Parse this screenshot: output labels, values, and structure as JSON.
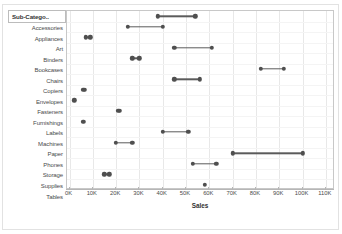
{
  "header": {
    "label": "Sub-Catego.."
  },
  "axis": {
    "x_title": "Sales",
    "x_ticks": [
      "0K",
      "10K",
      "20K",
      "30K",
      "40K",
      "50K",
      "60K",
      "70K",
      "80K",
      "90K",
      "100K",
      "110K"
    ]
  },
  "chart_data": {
    "type": "bar",
    "subtype": "dumbbell-range",
    "title": "",
    "xlabel": "Sales",
    "ylabel": "Sub-Catego..",
    "xlim": [
      0,
      115000
    ],
    "grid": true,
    "legend": "none",
    "categories": [
      "Accessories",
      "Appliances",
      "Art",
      "Binders",
      "Bookcases",
      "Chairs",
      "Copiers",
      "Envelopes",
      "Fasteners",
      "Furnishings",
      "Labels",
      "Machines",
      "Paper",
      "Phones",
      "Storage",
      "Supplies",
      "Tables"
    ],
    "series": [
      {
        "name": "Sales min",
        "values": [
          38000,
          25000,
          7000,
          45000,
          27000,
          82000,
          45000,
          6000,
          2000,
          21000,
          6000,
          40000,
          20000,
          70000,
          53000,
          15000,
          58000
        ]
      },
      {
        "name": "Sales max",
        "values": [
          54000,
          40000,
          9000,
          61000,
          30000,
          92000,
          56000,
          6500,
          2200,
          21500,
          6200,
          51000,
          27000,
          100000,
          63000,
          17000,
          58000
        ]
      }
    ],
    "marks": [
      {
        "category": "Accessories",
        "low": 38000,
        "high": 54000
      },
      {
        "category": "Appliances",
        "low": 25000,
        "high": 40000
      },
      {
        "category": "Art",
        "low": 7000,
        "high": 9000
      },
      {
        "category": "Binders",
        "low": 45000,
        "high": 61000
      },
      {
        "category": "Bookcases",
        "low": 27000,
        "high": 30000
      },
      {
        "category": "Chairs",
        "low": 82000,
        "high": 92000
      },
      {
        "category": "Copiers",
        "low": 45000,
        "high": 56000
      },
      {
        "category": "Envelopes",
        "low": 6000,
        "high": 6500
      },
      {
        "category": "Fasteners",
        "low": 2000,
        "high": 2200
      },
      {
        "category": "Furnishings",
        "low": 21000,
        "high": 21500
      },
      {
        "category": "Labels",
        "low": 6000,
        "high": 6200
      },
      {
        "category": "Machines",
        "low": 40000,
        "high": 51000
      },
      {
        "category": "Paper",
        "low": 20000,
        "high": 27000
      },
      {
        "category": "Phones",
        "low": 70000,
        "high": 100000
      },
      {
        "category": "Storage",
        "low": 53000,
        "high": 63000
      },
      {
        "category": "Supplies",
        "low": 15000,
        "high": 17000
      },
      {
        "category": "Tables",
        "low": 58000,
        "high": 58000
      }
    ]
  },
  "colors": {
    "mark": "#4f4f4f",
    "connector": "#5b5b5b",
    "grid": "#e8e8e8",
    "frame": "#c8c8c8",
    "text": "#333333"
  }
}
